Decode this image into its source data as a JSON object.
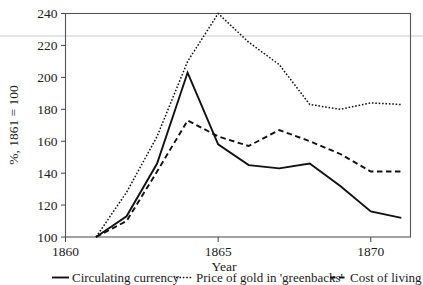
{
  "chart_data": {
    "type": "line",
    "title": "",
    "xlabel": "Year",
    "ylabel": "%, 1861 = 100",
    "x": [
      1861,
      1862,
      1863,
      1864,
      1865,
      1866,
      1867,
      1868,
      1869,
      1870,
      1871
    ],
    "xlim": [
      1860,
      1871.3
    ],
    "ylim": [
      100,
      240
    ],
    "xticks": [
      1860,
      1865,
      1870
    ],
    "xtick_labels": [
      "1860",
      "1865",
      "1870"
    ],
    "yticks": [
      100,
      120,
      140,
      160,
      180,
      200,
      220,
      240
    ],
    "ytick_labels": [
      "100",
      "120",
      "140",
      "160",
      "180",
      "200",
      "220",
      "240"
    ],
    "grid": false,
    "legend_position": "below",
    "series": [
      {
        "name": "Circulating currency",
        "style": "solid",
        "color": "#111111",
        "values": [
          100,
          113,
          146,
          203,
          158,
          145,
          143,
          146,
          132,
          116,
          112
        ]
      },
      {
        "name": "Price of gold in 'greenbacks'",
        "style": "dotted",
        "color": "#111111",
        "values": [
          100,
          128,
          163,
          210,
          240,
          222,
          208,
          183,
          180,
          184,
          183
        ]
      },
      {
        "name": "Cost of living",
        "style": "dashed",
        "color": "#111111",
        "values": [
          100,
          110,
          141,
          173,
          163,
          157,
          167,
          160,
          152,
          141,
          141
        ]
      }
    ]
  },
  "axis": {
    "ylabel": "%, 1861 = 100",
    "xlabel": "Year"
  },
  "legend": {
    "items": [
      {
        "label": "Circulating currency",
        "style": "solid"
      },
      {
        "label": "Price of gold in 'greenbacks'",
        "style": "dotted"
      },
      {
        "label": "Cost of living",
        "style": "dashed"
      }
    ]
  }
}
